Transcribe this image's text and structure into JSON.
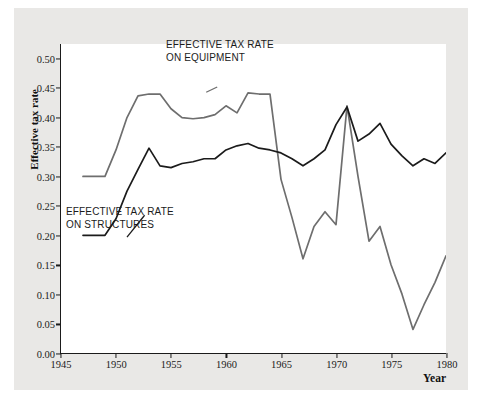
{
  "chart_data": {
    "type": "line",
    "title": "",
    "xlabel": "Year",
    "ylabel": "Effective tax rate",
    "xlim": [
      1945,
      1980
    ],
    "ylim": [
      0.0,
      0.525
    ],
    "grid": false,
    "legend_position": "inline-annotations",
    "xticks": [
      1945,
      1950,
      1955,
      1960,
      1965,
      1970,
      1975,
      1980
    ],
    "xtick_labels": [
      "1945",
      "1950",
      "1955",
      "1960",
      "1965",
      "1970",
      "1975",
      "1980"
    ],
    "yticks": [
      0.0,
      0.05,
      0.1,
      0.15,
      0.2,
      0.25,
      0.3,
      0.35,
      0.4,
      0.45,
      0.5
    ],
    "ytick_labels": [
      "0.00",
      "0.05",
      "0.10",
      "0.15",
      "0.20",
      "0.25",
      "0.30",
      "0.35",
      "0.40",
      "0.45",
      "0.50"
    ],
    "annotations": [
      {
        "id": "equipment",
        "text_line1": "EFFECTIVE TAX RATE",
        "text_line2": "ON EQUIPMENT"
      },
      {
        "id": "structures",
        "text_line1": "EFFECTIVE TAX RATE",
        "text_line2": "ON STRUCTURES"
      }
    ],
    "series": [
      {
        "name": "Effective tax rate on equipment",
        "color": "#6e6e6e",
        "x": [
          1947,
          1948,
          1949,
          1950,
          1951,
          1952,
          1953,
          1954,
          1955,
          1956,
          1957,
          1958,
          1959,
          1960,
          1961,
          1962,
          1963,
          1964,
          1965,
          1966,
          1967,
          1968,
          1969,
          1970,
          1971,
          1972,
          1973,
          1974,
          1975,
          1976,
          1977,
          1978,
          1979,
          1980
        ],
        "values": [
          0.3,
          0.3,
          0.3,
          0.345,
          0.4,
          0.437,
          0.44,
          0.44,
          0.415,
          0.4,
          0.398,
          0.4,
          0.405,
          0.42,
          0.408,
          0.442,
          0.44,
          0.44,
          0.295,
          0.23,
          0.16,
          0.215,
          0.24,
          0.218,
          0.42,
          0.3,
          0.19,
          0.215,
          0.15,
          0.1,
          0.04,
          0.082,
          0.12,
          0.165
        ]
      },
      {
        "name": "Effective tax rate on structures",
        "color": "#1b1b1b",
        "x": [
          1947,
          1948,
          1949,
          1950,
          1951,
          1952,
          1953,
          1954,
          1955,
          1956,
          1957,
          1958,
          1959,
          1960,
          1961,
          1962,
          1963,
          1964,
          1965,
          1966,
          1967,
          1968,
          1969,
          1970,
          1971,
          1972,
          1973,
          1974,
          1975,
          1976,
          1977,
          1978,
          1979,
          1980
        ],
        "values": [
          0.2,
          0.2,
          0.2,
          0.228,
          0.275,
          0.312,
          0.348,
          0.318,
          0.315,
          0.322,
          0.325,
          0.33,
          0.33,
          0.345,
          0.352,
          0.356,
          0.348,
          0.345,
          0.34,
          0.33,
          0.318,
          0.33,
          0.345,
          0.388,
          0.418,
          0.36,
          0.372,
          0.39,
          0.355,
          0.335,
          0.318,
          0.33,
          0.322,
          0.34
        ]
      }
    ]
  }
}
